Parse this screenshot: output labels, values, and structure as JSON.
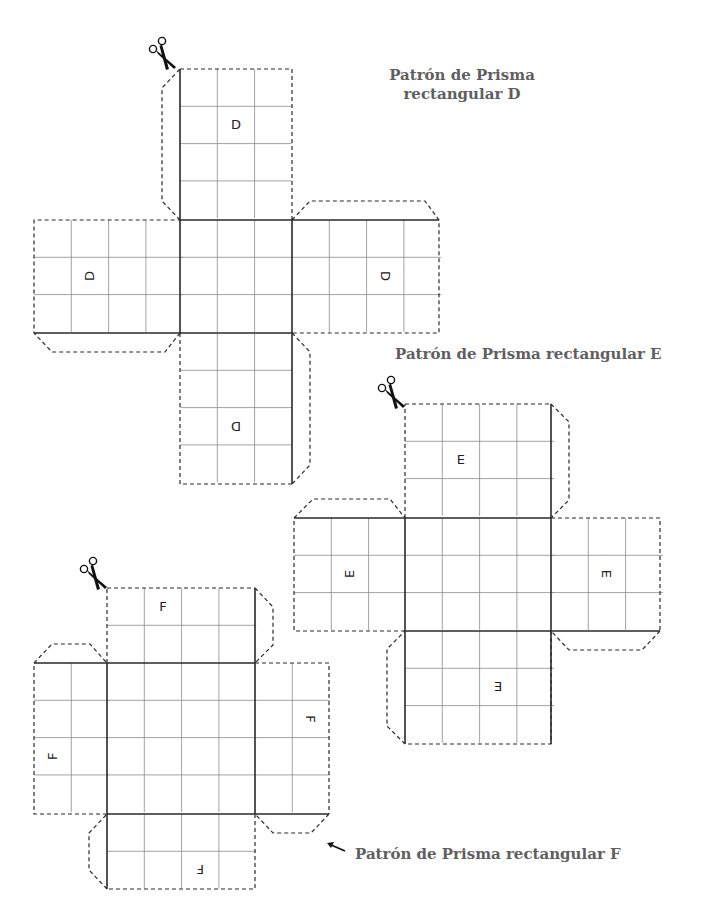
{
  "titles": {
    "d": {
      "line1": "Patrón de Prisma",
      "line2": "rectangular D"
    },
    "e": "Patrón de Prisma rectangular E",
    "f": "Patrón de Prisma rectangular F"
  },
  "colors": {
    "title": "#5f5f5f",
    "lines": "#2a2a2a",
    "grid": "#8a8a8a"
  },
  "cell_size": 37.3,
  "nets": [
    {
      "id": "D",
      "label": "D",
      "scissors": {
        "x": 147,
        "y": 37
      },
      "panels": [
        {
          "name": "top",
          "x": 180,
          "y": 69,
          "cols": 3,
          "rows": 4,
          "label_cell": [
            1,
            1
          ],
          "rotate": 0
        },
        {
          "name": "left",
          "x": 34,
          "y": 220,
          "cols": 4,
          "rows": 3,
          "label_cell": [
            1,
            1
          ],
          "rotate": -90
        },
        {
          "name": "center",
          "x": 180,
          "y": 220,
          "cols": 3,
          "rows": 3
        },
        {
          "name": "right",
          "x": 292,
          "y": 220,
          "cols": 4,
          "rows": 3,
          "label_cell": [
            2,
            1
          ],
          "rotate": 90
        },
        {
          "name": "bottom",
          "x": 180,
          "y": 333,
          "cols": 3,
          "rows": 4,
          "label_cell": [
            1,
            2
          ],
          "rotate": 180
        }
      ],
      "cut_path": "M180,69 L292,69 L292,220 M292,220 L310,201 L425,201 L439,220 L439,333 L292,333 M292,333 L310,352 L310,465 L292,484 M292,484 L180,484 L180,333 M180,333 L165,352 L52,352 L34,333 L34,220 L180,220 M180,220 L162,201 L162,88 L180,69",
      "fold_path": "M180,69 L180,220 M180,220 L439,220 M34,333 L292,333 M292,220 L292,333 M180,220 L180,333 M292,333 L292,484"
    },
    {
      "id": "E",
      "label": "E",
      "scissors": {
        "x": 376,
        "y": 376
      },
      "panels": [
        {
          "name": "top",
          "x": 405,
          "y": 404,
          "cols": 4,
          "rows": 3,
          "label_cell": [
            1,
            1
          ],
          "rotate": 0
        },
        {
          "name": "left",
          "x": 294,
          "y": 518,
          "cols": 3,
          "rows": 3,
          "label_cell": [
            1,
            1
          ],
          "rotate": -90
        },
        {
          "name": "center",
          "x": 405,
          "y": 518,
          "cols": 4,
          "rows": 3
        },
        {
          "name": "right",
          "x": 551,
          "y": 518,
          "cols": 3,
          "rows": 3,
          "label_cell": [
            1,
            1
          ],
          "rotate": 90
        },
        {
          "name": "bottom",
          "x": 405,
          "y": 631,
          "cols": 4,
          "rows": 3,
          "label_cell": [
            2,
            1
          ],
          "rotate": 180
        }
      ],
      "cut_path": "M405,404 L551,404 M551,404 L569,422 L569,500 L551,518 M551,518 L660,518 L660,631 M660,631 L642,650 L569,650 L551,631 M551,631 L551,744 L405,744 M405,744 L387,726 L387,649 L405,631 M405,631 L294,631 L294,518 M294,518 L313,499 L390,499 L405,518 M405,518 L405,404",
      "fold_path": "M551,404 L551,744 M294,518 L551,518 M405,631 L660,631 M405,518 L405,744 M551,518 L551,631"
    },
    {
      "id": "F",
      "label": "F",
      "scissors": {
        "x": 78,
        "y": 557
      },
      "panels": [
        {
          "name": "top",
          "x": 107,
          "y": 588,
          "cols": 4,
          "rows": 2,
          "label_cell": [
            1,
            0
          ],
          "rotate": 0
        },
        {
          "name": "left",
          "x": 34,
          "y": 663,
          "cols": 2,
          "rows": 4,
          "label_cell": [
            0,
            2
          ],
          "rotate": -90
        },
        {
          "name": "center",
          "x": 107,
          "y": 663,
          "cols": 4,
          "rows": 4
        },
        {
          "name": "right",
          "x": 255,
          "y": 663,
          "cols": 2,
          "rows": 4,
          "label_cell": [
            1,
            1
          ],
          "rotate": 90
        },
        {
          "name": "bottom",
          "x": 107,
          "y": 814,
          "cols": 4,
          "rows": 2,
          "label_cell": [
            2,
            1
          ],
          "rotate": 180
        }
      ],
      "cut_path": "M107,588 L255,588 M255,588 L273,607 L273,645 L255,663 M255,663 L329,663 L329,814 M329,814 L311,833 L273,833 L255,814 M255,814 L255,889 L107,889 M107,889 L89,870 L89,833 L107,814 M107,814 L34,814 L34,663 M34,663 L52,644 L90,644 L107,663 M107,663 L107,588",
      "fold_path": "M255,588 L255,814 M34,663 L255,663 M107,814 L329,814 M107,663 L107,889 M255,663 L255,814"
    }
  ],
  "arrow": {
    "x1": 345,
    "y1": 851,
    "x2": 327,
    "y2": 843,
    "icon": "arrow-up-left-icon"
  }
}
